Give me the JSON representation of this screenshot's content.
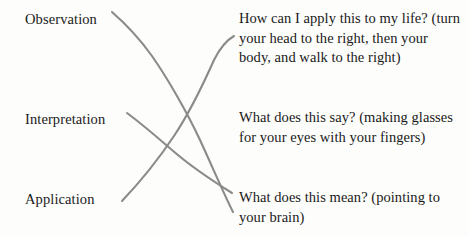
{
  "diagram": {
    "background_color": "#fdfdfb",
    "text_color": "#1a1a1a",
    "connector_color": "#8a8a8a"
  },
  "left_column": {
    "items": [
      {
        "id": "observation",
        "label": "Observation"
      },
      {
        "id": "interpretation",
        "label": "Interpretation"
      },
      {
        "id": "application",
        "label": "Application"
      }
    ]
  },
  "right_column": {
    "items": [
      {
        "id": "application-text",
        "text": "How can I apply this to my life? (turn your head to the right, then your body, and walk to the right)"
      },
      {
        "id": "interpretation-text",
        "text": "What does this say? (making glasses for your eyes with your fingers)"
      },
      {
        "id": "observation-text",
        "text": "What does this mean? (pointing to your brain)"
      }
    ]
  },
  "connectors": [
    {
      "id": "observation-to-meaning",
      "from": "observation",
      "to": "observation-text",
      "path": "M 112 12 C 128 26, 142 42, 152 56 C 166 76, 186 110, 200 140 C 212 166, 224 194, 233 212"
    },
    {
      "id": "interpretation-to-say",
      "from": "interpretation",
      "to": "interpretation-text",
      "path": "M 127 113 C 142 124, 158 138, 172 150 C 188 164, 208 178, 232 193"
    },
    {
      "id": "application-to-apply",
      "from": "application",
      "to": "application-text",
      "path": "M 122 201 C 140 182, 158 160, 174 136 C 190 112, 206 78, 214 60 C 220 48, 227 40, 234 36"
    }
  ]
}
